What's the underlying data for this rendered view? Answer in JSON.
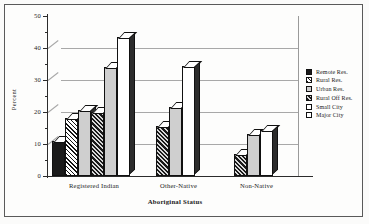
{
  "chart_data": {
    "type": "bar",
    "title": "",
    "xlabel": "Aboriginal Status",
    "ylabel": "Percent",
    "ylim": [
      0,
      50
    ],
    "ytick_labels": [
      "0",
      "10",
      "20",
      "30",
      "40",
      "50"
    ],
    "ytick_values": [
      0,
      10,
      20,
      30,
      40,
      50
    ],
    "yminor_values": [
      5,
      15,
      25,
      35,
      45
    ],
    "grid": true,
    "legend_position": "right",
    "categories": [
      "Registered Indian",
      "Other-Native",
      "Non-Native"
    ],
    "series": [
      {
        "name": "Remote Res.",
        "pattern": "solid",
        "values": [
          11,
          null,
          null
        ]
      },
      {
        "name": "Rural Res.",
        "pattern": "hatch",
        "values": [
          18,
          null,
          null
        ]
      },
      {
        "name": "Urban Res.",
        "pattern": "lgray",
        "values": [
          20.5,
          null,
          null
        ]
      },
      {
        "name": "Rural Off Res.",
        "pattern": "dense",
        "values": [
          20,
          15.5,
          7
        ]
      },
      {
        "name": "Small City",
        "pattern": "lgray",
        "values": [
          34,
          21.5,
          13
        ]
      },
      {
        "name": "Major City",
        "pattern": "white",
        "values": [
          43.5,
          34.5,
          14.5
        ]
      }
    ]
  },
  "axis": {
    "y_title": "Percent",
    "x_title": "Aboriginal Status",
    "y_labels": [
      {
        "text": "50",
        "value": 50
      },
      {
        "text": "40",
        "value": 40
      },
      {
        "text": "30",
        "value": 30
      },
      {
        "text": "20",
        "value": 20
      },
      {
        "text": "10",
        "value": 10
      },
      {
        "text": "0",
        "value": 0
      }
    ],
    "x_labels": [
      "Registered Indian",
      "Other-Native",
      "Non-Native"
    ]
  },
  "legend": {
    "items": [
      {
        "label": "Remote Res.",
        "pattern": "p-solid"
      },
      {
        "label": "Rural Res.",
        "pattern": "p-hatch"
      },
      {
        "label": "Urban Res.",
        "pattern": "p-lgray"
      },
      {
        "label": "Rural Off Res.",
        "pattern": "p-dense"
      },
      {
        "label": "Small City",
        "pattern": "p-white"
      },
      {
        "label": "Major City",
        "pattern": "p-white"
      }
    ]
  },
  "colors": {
    "axis": "#2b2b2b",
    "grid": "#a8a8a8",
    "bar_outline": "#111111",
    "bar_side": "#2c2c2c",
    "background": "#fdfdfc"
  }
}
